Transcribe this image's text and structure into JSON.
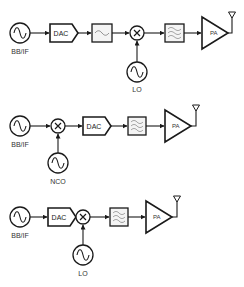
{
  "diagram": {
    "type": "rf-transmitter-architectures",
    "colors": {
      "stroke": "#1a1a1a",
      "filter_fill": "#f4f4f4",
      "background": "#ffffff"
    },
    "chains": [
      {
        "id": "chain-1",
        "blocks": [
          "BB/IF source",
          "DAC",
          "Low-pass filter",
          "Mixer",
          "Band-pass filter",
          "PA",
          "Antenna"
        ],
        "source_label": "BB/IF",
        "dac_label": "DAC",
        "pa_label": "PA",
        "oscillator_label": "LO"
      },
      {
        "id": "chain-2",
        "blocks": [
          "BB/IF source",
          "Mixer",
          "DAC",
          "Band-pass filter",
          "PA",
          "Antenna"
        ],
        "source_label": "BB/IF",
        "dac_label": "DAC",
        "pa_label": "PA",
        "oscillator_label": "NCO"
      },
      {
        "id": "chain-3",
        "blocks": [
          "BB/IF source",
          "DAC",
          "Mixer",
          "Band-pass filter",
          "PA",
          "Antenna"
        ],
        "source_label": "BB/IF",
        "dac_label": "DAC",
        "pa_label": "PA",
        "oscillator_label": "LO"
      }
    ]
  }
}
